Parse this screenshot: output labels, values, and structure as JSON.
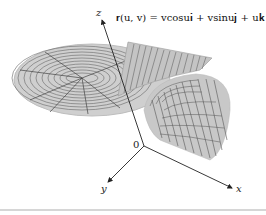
{
  "figure": {
    "equation": "r(u, v) = v cos u i + v sin u j + u k",
    "equation_display": "𝐫(u, v) = vcosu𝐢 + vsinu𝐣 + u𝐤",
    "surface": "helicoid",
    "axes": {
      "x_label": "x",
      "y_label": "y",
      "z_label": "z",
      "origin_label": "0"
    },
    "colors": {
      "surface_fill": "#c8c8c8",
      "grid_line": "#555555",
      "axis": "#222222",
      "divider": "#d6d6d6"
    }
  }
}
